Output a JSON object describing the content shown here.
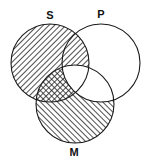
{
  "diagram": {
    "type": "venn-3",
    "colors": {
      "stroke": "#1a1a1a",
      "hatch": "#222222",
      "background": "#ffffff"
    },
    "circles": [
      {
        "id": "S",
        "label": "S",
        "cx": 50,
        "cy": 63,
        "r": 39,
        "label_x": 50,
        "label_y": 16
      },
      {
        "id": "P",
        "label": "P",
        "cx": 101,
        "cy": 63,
        "r": 39,
        "label_x": 101,
        "label_y": 15
      },
      {
        "id": "M",
        "label": "M",
        "cx": 75,
        "cy": 104,
        "r": 39,
        "label_x": 74,
        "label_y": 153
      }
    ],
    "regions": [
      {
        "region": "S only",
        "shading": "hatched-backslash"
      },
      {
        "region": "P only",
        "shading": "none"
      },
      {
        "region": "M only",
        "shading": "hatched-slash"
      },
      {
        "region": "S∩P not M",
        "shading": "hatched-backslash"
      },
      {
        "region": "S∩M not P",
        "shading": "cross-hatched"
      },
      {
        "region": "P∩M not S",
        "shading": "none"
      },
      {
        "region": "S∩P∩M",
        "shading": "none"
      }
    ]
  }
}
